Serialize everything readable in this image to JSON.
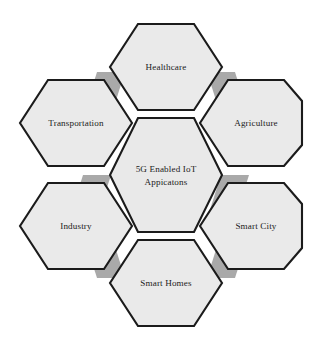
{
  "diagram": {
    "type": "hexagon-cluster",
    "title": "5G Enabled IoT Appicatons",
    "center": {
      "id": "center",
      "lines": [
        "5G Enabled IoT",
        "Appicatons"
      ],
      "line1": "5G Enabled IoT",
      "line2": "Appicatons"
    },
    "colors": {
      "hex_fill": "#eaeaea",
      "hex_stroke": "#1b1b1b",
      "wedge_fill": "#a9a9a9",
      "background": "#ffffff",
      "text": "#1a1a1a"
    },
    "nodes": [
      {
        "id": "healthcare",
        "label": "Healthcare",
        "position": "top"
      },
      {
        "id": "agriculture",
        "label": "Agriculture",
        "position": "top-right"
      },
      {
        "id": "smart-city",
        "label": "Smart City",
        "position": "bottom-right"
      },
      {
        "id": "smart-homes",
        "label": "Smart Homes",
        "position": "bottom"
      },
      {
        "id": "industry",
        "label": "Industry",
        "position": "bottom-left"
      },
      {
        "id": "transportation",
        "label": "Transportation",
        "position": "top-left"
      }
    ]
  }
}
